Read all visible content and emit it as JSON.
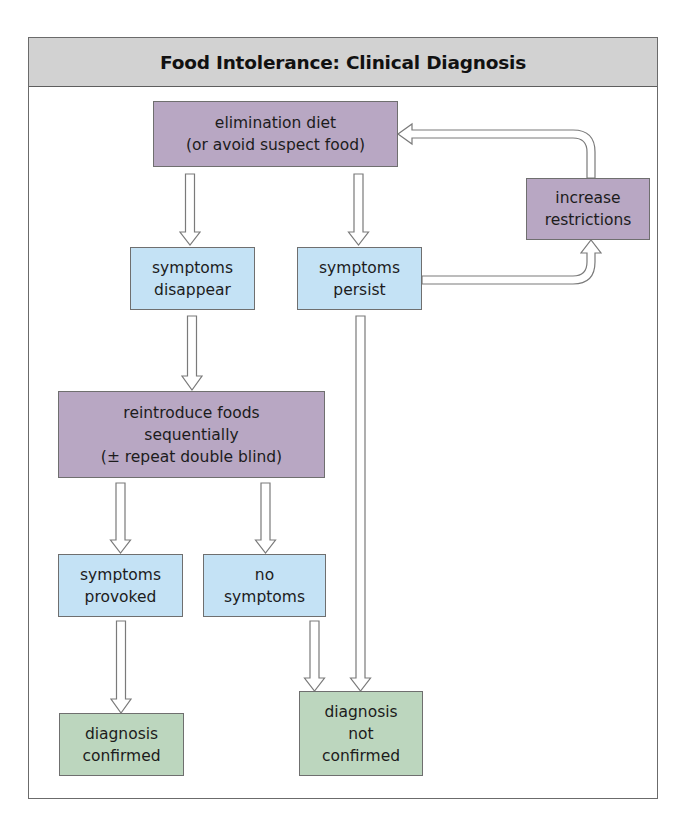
{
  "title": "Food Intolerance: Clinical Diagnosis",
  "colors": {
    "header_bg": "#d2d2d2",
    "action_box": "#b8a7c3",
    "observation_box": "#c4e2f5",
    "outcome_box": "#bcd6be",
    "arrow_stroke": "#7a7a7a"
  },
  "nodes": {
    "elimination": {
      "lines": [
        "elimination diet",
        "(or avoid suspect food)"
      ],
      "type": "action"
    },
    "increase": {
      "lines": [
        "increase",
        "restrictions"
      ],
      "type": "action"
    },
    "disappear": {
      "lines": [
        "symptoms",
        "disappear"
      ],
      "type": "observation"
    },
    "persist": {
      "lines": [
        "symptoms",
        "persist"
      ],
      "type": "observation"
    },
    "reintroduce": {
      "lines": [
        "reintroduce foods",
        "sequentially",
        "(± repeat double blind)"
      ],
      "type": "action"
    },
    "provoked": {
      "lines": [
        "symptoms",
        "provoked"
      ],
      "type": "observation"
    },
    "nosymptoms": {
      "lines": [
        "no",
        "symptoms"
      ],
      "type": "observation"
    },
    "confirmed": {
      "lines": [
        "diagnosis",
        "confirmed"
      ],
      "type": "outcome"
    },
    "notconfirmed": {
      "lines": [
        "diagnosis",
        "not",
        "confirmed"
      ],
      "type": "outcome"
    }
  },
  "edges": [
    {
      "from": "elimination",
      "to": "disappear"
    },
    {
      "from": "elimination",
      "to": "persist"
    },
    {
      "from": "persist",
      "to": "increase"
    },
    {
      "from": "increase",
      "to": "elimination"
    },
    {
      "from": "disappear",
      "to": "reintroduce"
    },
    {
      "from": "persist",
      "to": "notconfirmed"
    },
    {
      "from": "reintroduce",
      "to": "provoked"
    },
    {
      "from": "reintroduce",
      "to": "nosymptoms"
    },
    {
      "from": "provoked",
      "to": "confirmed"
    },
    {
      "from": "nosymptoms",
      "to": "notconfirmed"
    }
  ]
}
